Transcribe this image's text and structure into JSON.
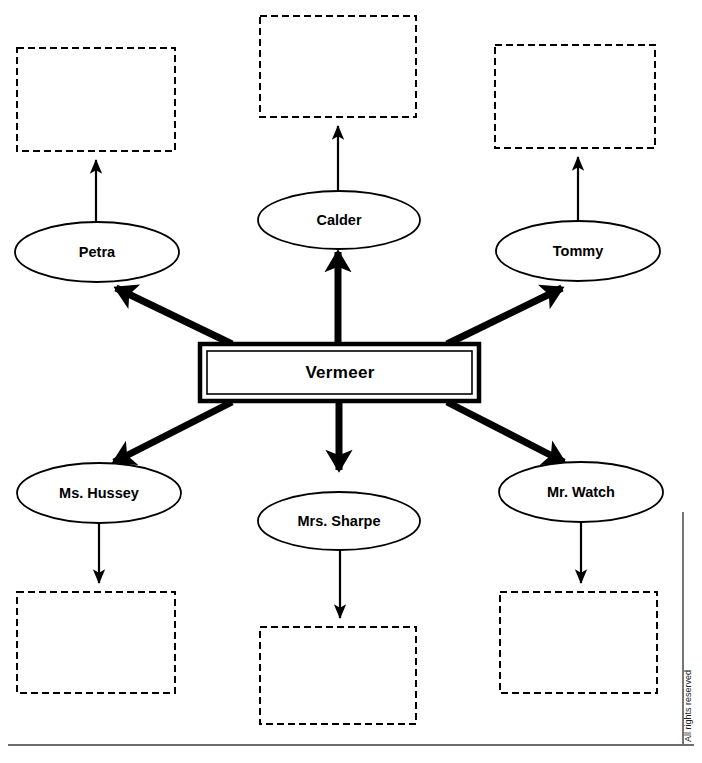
{
  "diagram": {
    "type": "character-relationship-web",
    "center": {
      "label": "Vermeer",
      "shape": "double-rectangle"
    },
    "people": [
      {
        "id": "petra",
        "label": "Petra",
        "position": "top-left",
        "shape": "ellipse"
      },
      {
        "id": "calder",
        "label": "Calder",
        "position": "top-center",
        "shape": "ellipse"
      },
      {
        "id": "tommy",
        "label": "Tommy",
        "position": "top-right",
        "shape": "ellipse"
      },
      {
        "id": "ms-hussey",
        "label": "Ms. Hussey",
        "position": "bottom-left",
        "shape": "ellipse"
      },
      {
        "id": "mrs-sharpe",
        "label": "Mrs. Sharpe",
        "position": "bottom-center",
        "shape": "ellipse"
      },
      {
        "id": "mr-watch",
        "label": "Mr. Watch",
        "position": "bottom-right",
        "shape": "ellipse"
      }
    ],
    "answer_boxes": [
      {
        "id": "answer-petra",
        "label": "",
        "for": "petra"
      },
      {
        "id": "answer-calder",
        "label": "",
        "for": "calder"
      },
      {
        "id": "answer-tommy",
        "label": "",
        "for": "tommy"
      },
      {
        "id": "answer-ms-hussey",
        "label": "",
        "for": "ms-hussey"
      },
      {
        "id": "answer-mrs-sharpe",
        "label": "",
        "for": "mrs-sharpe"
      },
      {
        "id": "answer-mr-watch",
        "label": "",
        "for": "mr-watch"
      }
    ],
    "connectors": [
      {
        "from": "Vermeer",
        "to": "Petra",
        "style": "thick"
      },
      {
        "from": "Vermeer",
        "to": "Calder",
        "style": "thick"
      },
      {
        "from": "Vermeer",
        "to": "Tommy",
        "style": "thick"
      },
      {
        "from": "Vermeer",
        "to": "Ms. Hussey",
        "style": "thick"
      },
      {
        "from": "Vermeer",
        "to": "Mrs. Sharpe",
        "style": "thick"
      },
      {
        "from": "Vermeer",
        "to": "Mr. Watch",
        "style": "thick"
      },
      {
        "from": "Petra",
        "to": "answer-petra",
        "style": "thin"
      },
      {
        "from": "Calder",
        "to": "answer-calder",
        "style": "thin"
      },
      {
        "from": "Tommy",
        "to": "answer-tommy",
        "style": "thin"
      },
      {
        "from": "Ms. Hussey",
        "to": "answer-ms-hussey",
        "style": "thin"
      },
      {
        "from": "Mrs. Sharpe",
        "to": "answer-mrs-sharpe",
        "style": "thin"
      },
      {
        "from": "Mr. Watch",
        "to": "answer-mr-watch",
        "style": "thin"
      }
    ]
  },
  "footer": {
    "copyright": "All rights reserved"
  },
  "colors": {
    "ink": "#000000",
    "rule": "#3c3c3c",
    "page": "#ffffff"
  }
}
